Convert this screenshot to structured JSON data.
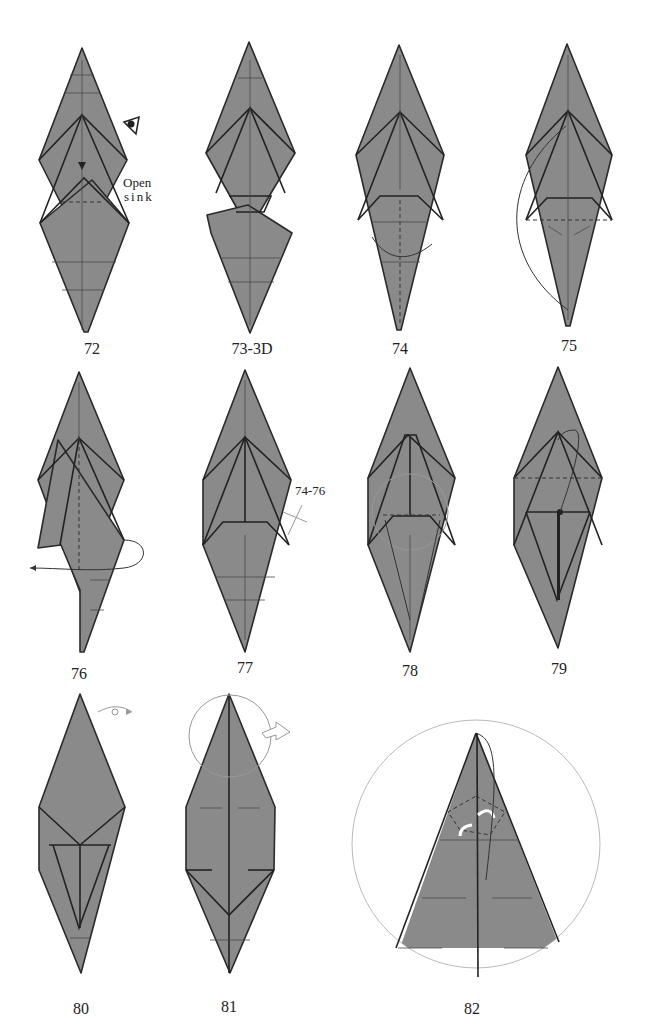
{
  "page": {
    "background": "#ffffff",
    "paper_color": "#8a8a8a",
    "line_color": "#2a2a2a"
  },
  "steps": [
    {
      "label": "72",
      "x": 92,
      "y": 340
    },
    {
      "label": "73-3D",
      "x": 252,
      "y": 340
    },
    {
      "label": "74",
      "x": 400,
      "y": 340
    },
    {
      "label": "75",
      "x": 569,
      "y": 337
    },
    {
      "label": "76",
      "x": 79,
      "y": 665
    },
    {
      "label": "77",
      "x": 245,
      "y": 659
    },
    {
      "label": "78",
      "x": 410,
      "y": 662
    },
    {
      "label": "79",
      "x": 559,
      "y": 660
    },
    {
      "label": "80",
      "x": 81,
      "y": 1000
    },
    {
      "label": "81",
      "x": 229,
      "y": 998
    },
    {
      "label": "82",
      "x": 472,
      "y": 1000
    }
  ],
  "annotations": {
    "open_sink_line1": "Open",
    "open_sink_line2": "sink",
    "repeat_steps": "74-76"
  },
  "icons": [
    "eye-icon",
    "sink-arrow-icon",
    "turn-over-icon",
    "push-arrow-icon",
    "zoom-circle-icon",
    "reverse-fold-arrows-icon"
  ]
}
